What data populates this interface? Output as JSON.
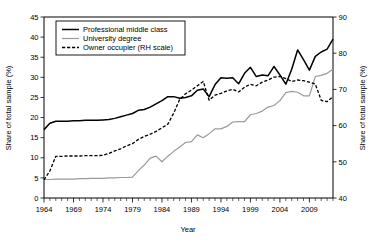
{
  "chart_data": {
    "type": "line",
    "title": "",
    "xlabel": "Year",
    "ylabel": "Share of total sample (%)",
    "ylabel_right": "Share of total sample (%)",
    "xlim": [
      1964,
      2013
    ],
    "ylim": [
      0,
      45
    ],
    "ylim_right": [
      40,
      90
    ],
    "yticks": [
      0,
      5,
      10,
      15,
      20,
      25,
      30,
      35,
      40,
      45
    ],
    "yticks_right": [
      40,
      50,
      60,
      70,
      80,
      90
    ],
    "xticks": [
      1964,
      1969,
      1974,
      1979,
      1984,
      1989,
      1994,
      1999,
      2004,
      2009
    ],
    "xticks_minor_step": 1,
    "grid": false,
    "legend_position": "top-left",
    "x": [
      1964,
      1965,
      1966,
      1967,
      1968,
      1969,
      1970,
      1971,
      1972,
      1973,
      1974,
      1975,
      1976,
      1977,
      1978,
      1979,
      1980,
      1981,
      1982,
      1983,
      1984,
      1985,
      1986,
      1987,
      1988,
      1989,
      1990,
      1991,
      1992,
      1993,
      1994,
      1995,
      1996,
      1997,
      1998,
      1999,
      2000,
      2001,
      2002,
      2003,
      2004,
      2005,
      2006,
      2007,
      2008,
      2009,
      2010,
      2011,
      2012,
      2013
    ],
    "series": [
      {
        "name": "Professional middle class",
        "axis": "left",
        "style": "solid",
        "color": "#000000",
        "values": [
          17.0,
          18.6,
          19.1,
          19.1,
          19.1,
          19.2,
          19.2,
          19.3,
          19.3,
          19.3,
          19.4,
          19.5,
          19.8,
          20.2,
          20.6,
          21.0,
          21.8,
          22.0,
          22.6,
          23.4,
          24.2,
          25.2,
          25.2,
          24.8,
          25.0,
          25.4,
          26.8,
          27.1,
          25.2,
          28.2,
          29.9,
          29.8,
          29.9,
          28.4,
          31.0,
          32.5,
          30.2,
          30.6,
          30.4,
          32.7,
          30.6,
          28.3,
          32.0,
          36.8,
          34.4,
          31.8,
          35.2,
          36.3,
          37.0,
          39.5
        ]
      },
      {
        "name": "University degree",
        "axis": "left",
        "style": "solid",
        "color": "#9a9a9a",
        "values": [
          4.6,
          4.6,
          4.7,
          4.7,
          4.7,
          4.7,
          4.8,
          4.8,
          4.9,
          4.9,
          4.9,
          5.0,
          5.0,
          5.1,
          5.1,
          5.2,
          6.8,
          8.2,
          9.9,
          10.4,
          9.0,
          10.4,
          11.6,
          12.7,
          13.8,
          14.0,
          15.7,
          15.0,
          16.0,
          17.2,
          17.2,
          17.8,
          18.9,
          19.0,
          19.0,
          20.7,
          21.0,
          21.6,
          22.6,
          23.0,
          24.2,
          26.2,
          26.5,
          26.3,
          25.4,
          25.4,
          30.2,
          30.5,
          31.0,
          32.0
        ]
      },
      {
        "name": "Owner occupier (RH scale)",
        "axis": "right",
        "style": "dashed",
        "color": "#000000",
        "values": [
          45.0,
          47.5,
          51.5,
          51.5,
          51.6,
          51.6,
          51.6,
          51.7,
          51.7,
          51.7,
          51.8,
          52.3,
          53.0,
          53.6,
          54.4,
          55.0,
          56.2,
          57.0,
          57.6,
          58.4,
          59.4,
          60.4,
          63.5,
          67.2,
          68.8,
          69.8,
          71.0,
          72.2,
          67.0,
          68.4,
          68.9,
          69.6,
          70.0,
          69.3,
          70.6,
          71.4,
          71.0,
          72.0,
          72.6,
          73.4,
          73.6,
          73.0,
          72.2,
          72.6,
          72.4,
          72.0,
          71.5,
          67.0,
          66.6,
          68.0
        ]
      }
    ]
  },
  "legend": {
    "items": [
      {
        "label": "Professional middle class"
      },
      {
        "label": "University degree"
      },
      {
        "label": "Owner occupier (RH scale)"
      }
    ]
  },
  "axes": {
    "left_title": "Share of total sample (%)",
    "right_title": "Share of total sample (%)",
    "bottom_title": "Year",
    "left_ticklabels": [
      "0",
      "5",
      "10",
      "15",
      "20",
      "25",
      "30",
      "35",
      "40",
      "45"
    ],
    "right_ticklabels": [
      "40",
      "50",
      "60",
      "70",
      "80",
      "90"
    ],
    "bottom_ticklabels": [
      "1964",
      "1969",
      "1974",
      "1979",
      "1984",
      "1989",
      "1994",
      "1999",
      "2004",
      "2009"
    ]
  }
}
